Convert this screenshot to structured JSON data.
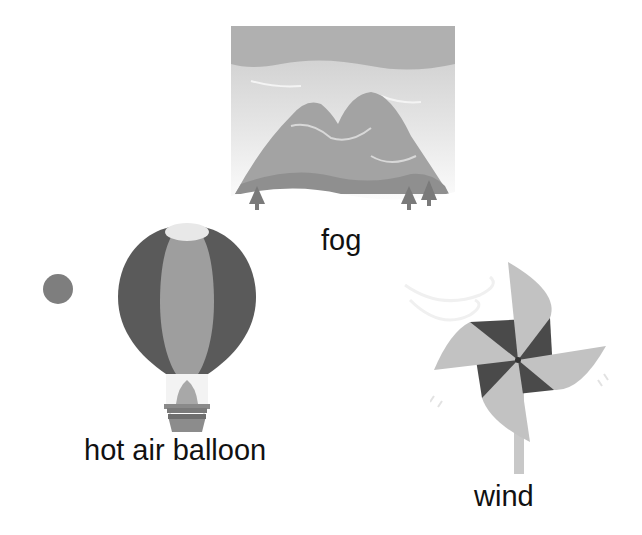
{
  "cards": [
    {
      "id": "fog",
      "label": "fog",
      "icon": "fog-mountains-icon"
    },
    {
      "id": "hot-air-balloon",
      "label": "hot air balloon",
      "icon": "hot-air-balloon-icon"
    },
    {
      "id": "wind",
      "label": "wind",
      "icon": "pinwheel-icon"
    }
  ],
  "decor": {
    "dot": "gray-dot"
  },
  "colors": {
    "dark": "#545454",
    "mid": "#8c8c8c",
    "light": "#b4b4b4",
    "pale": "#d9d9d9",
    "text": "#111111"
  }
}
